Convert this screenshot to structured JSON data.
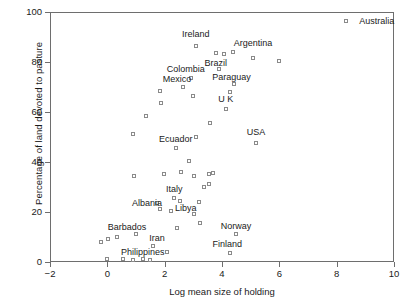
{
  "chart_data": {
    "type": "scatter",
    "title": "",
    "xlabel": "Log mean size of holding",
    "ylabel": "Percentage of land devoted to pasture",
    "xlim": [
      -2,
      10
    ],
    "ylim": [
      0,
      100
    ],
    "xticks": [
      -2,
      0,
      2,
      4,
      6,
      8,
      10
    ],
    "xticklabels": [
      "−2",
      "0",
      "2",
      "4",
      "6",
      "8",
      "10"
    ],
    "yticks": [
      0,
      20,
      40,
      60,
      80,
      100
    ],
    "yticklabels": [
      "0",
      "20",
      "40",
      "60",
      "80",
      "100"
    ],
    "grid": false,
    "legend": null,
    "marker": "open-square",
    "marker_color": "#8a8a8a",
    "frame_color": "#6e6e6e",
    "points": [
      {
        "x": 8.3,
        "y": 97.0,
        "label": "Australia"
      },
      {
        "x": 3.05,
        "y": 87.0,
        "label": "Ireland"
      },
      {
        "x": 4.05,
        "y": 83.5,
        "label": "Argentina"
      },
      {
        "x": 5.05,
        "y": 82.0,
        "label": null
      },
      {
        "x": 5.95,
        "y": 81.0,
        "label": null
      },
      {
        "x": 3.75,
        "y": 84.0,
        "label": "Brazil"
      },
      {
        "x": 4.35,
        "y": 84.5,
        "label": null
      },
      {
        "x": 3.85,
        "y": 77.5,
        "label": null
      },
      {
        "x": 2.9,
        "y": 74.0,
        "label": "Colombia"
      },
      {
        "x": 2.6,
        "y": 70.5,
        "label": "Mexico"
      },
      {
        "x": 4.4,
        "y": 71.5,
        "label": "Paraguay"
      },
      {
        "x": 4.25,
        "y": 68.5,
        "label": null
      },
      {
        "x": 1.8,
        "y": 69.0,
        "label": null
      },
      {
        "x": 2.95,
        "y": 67.0,
        "label": null
      },
      {
        "x": 1.85,
        "y": 64.0,
        "label": null
      },
      {
        "x": 1.3,
        "y": 59.0,
        "label": null
      },
      {
        "x": 4.1,
        "y": 61.5,
        "label": "U K"
      },
      {
        "x": 3.55,
        "y": 56.0,
        "label": null
      },
      {
        "x": 5.15,
        "y": 48.0,
        "label": "USA"
      },
      {
        "x": 0.85,
        "y": 51.5,
        "label": null
      },
      {
        "x": 3.05,
        "y": 50.5,
        "label": null
      },
      {
        "x": 2.35,
        "y": 46.0,
        "label": "Ecuador"
      },
      {
        "x": 2.8,
        "y": 41.0,
        "label": null
      },
      {
        "x": 2.55,
        "y": 36.5,
        "label": null
      },
      {
        "x": 3.0,
        "y": 35.0,
        "label": null
      },
      {
        "x": 1.95,
        "y": 35.5,
        "label": null
      },
      {
        "x": 0.9,
        "y": 35.0,
        "label": null
      },
      {
        "x": 3.5,
        "y": 35.5,
        "label": null
      },
      {
        "x": 3.65,
        "y": 36.0,
        "label": null
      },
      {
        "x": 3.35,
        "y": 30.5,
        "label": null
      },
      {
        "x": 3.5,
        "y": 31.5,
        "label": null
      },
      {
        "x": 2.3,
        "y": 26.0,
        "label": "Italy"
      },
      {
        "x": 3.15,
        "y": 24.5,
        "label": null
      },
      {
        "x": 1.7,
        "y": 24.0,
        "label": "Albania"
      },
      {
        "x": 2.5,
        "y": 25.0,
        "label": "Libya"
      },
      {
        "x": 1.8,
        "y": 21.5,
        "label": null
      },
      {
        "x": 2.2,
        "y": 21.0,
        "label": null
      },
      {
        "x": 3.0,
        "y": 19.5,
        "label": null
      },
      {
        "x": 3.2,
        "y": 16.0,
        "label": null
      },
      {
        "x": 2.4,
        "y": 14.0,
        "label": null
      },
      {
        "x": 4.45,
        "y": 11.5,
        "label": "Norway"
      },
      {
        "x": 4.25,
        "y": 4.0,
        "label": "Finland"
      },
      {
        "x": 0.95,
        "y": 11.5,
        "label": "Barbados"
      },
      {
        "x": 0.3,
        "y": 10.5,
        "label": null
      },
      {
        "x": -0.25,
        "y": 8.5,
        "label": null
      },
      {
        "x": 0.0,
        "y": 9.5,
        "label": null
      },
      {
        "x": 1.55,
        "y": 7.0,
        "label": "Iran"
      },
      {
        "x": 2.05,
        "y": 4.5,
        "label": null
      },
      {
        "x": 1.2,
        "y": 1.5,
        "label": "Philippines"
      },
      {
        "x": -0.05,
        "y": 1.5,
        "label": null
      },
      {
        "x": 0.5,
        "y": 1.5,
        "label": null
      },
      {
        "x": 0.85,
        "y": 1.2,
        "label": null
      },
      {
        "x": 1.45,
        "y": 1.2,
        "label": null
      }
    ],
    "annotations": [
      {
        "text": "Australia",
        "x": 8.75,
        "y": 97.0,
        "align": "left"
      },
      {
        "text": "Ireland",
        "x": 3.05,
        "y": 91.5,
        "align": "center"
      },
      {
        "text": "Argentina",
        "x": 5.05,
        "y": 88.0,
        "align": "center"
      },
      {
        "text": "Brazil",
        "x": 3.75,
        "y": 80.0,
        "align": "center"
      },
      {
        "text": "Colombia",
        "x": 2.7,
        "y": 77.5,
        "align": "center"
      },
      {
        "text": "Mexico",
        "x": 2.4,
        "y": 73.5,
        "align": "center"
      },
      {
        "text": "Paraguay",
        "x": 4.3,
        "y": 74.5,
        "align": "center"
      },
      {
        "text": "U K",
        "x": 4.1,
        "y": 65.5,
        "align": "center"
      },
      {
        "text": "USA",
        "x": 5.15,
        "y": 52.5,
        "align": "center"
      },
      {
        "text": "Ecuador",
        "x": 2.35,
        "y": 49.5,
        "align": "center"
      },
      {
        "text": "Italy",
        "x": 2.3,
        "y": 29.5,
        "align": "center"
      },
      {
        "text": "Albania",
        "x": 1.35,
        "y": 24.0,
        "align": "center"
      },
      {
        "text": "Libya",
        "x": 2.7,
        "y": 22.0,
        "align": "center"
      },
      {
        "text": "Barbados",
        "x": 0.65,
        "y": 14.5,
        "align": "center"
      },
      {
        "text": "Iran",
        "x": 1.7,
        "y": 10.0,
        "align": "center"
      },
      {
        "text": "Norway",
        "x": 4.45,
        "y": 15.0,
        "align": "center"
      },
      {
        "text": "Finland",
        "x": 4.15,
        "y": 7.5,
        "align": "center"
      },
      {
        "text": "Philippines",
        "x": 1.2,
        "y": 4.5,
        "align": "center"
      }
    ]
  }
}
